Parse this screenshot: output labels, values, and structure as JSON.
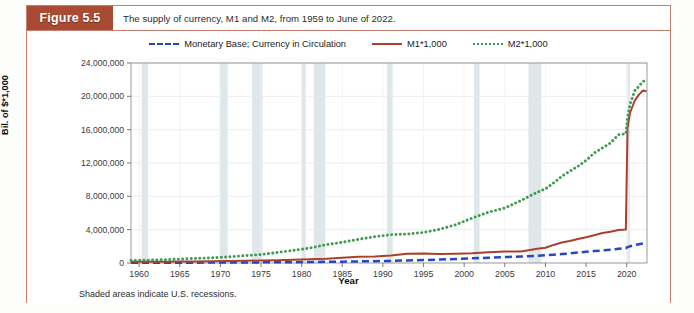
{
  "figure": {
    "badge_label": "Figure 5.5",
    "caption": "The supply of currency, M1 and M2, from 1959 to June of 2022.",
    "footnote": "Shaded areas indicate U.S. recessions.",
    "accent_color": "#a94a32",
    "frame_color": "#c77f72"
  },
  "chart_data": {
    "type": "line",
    "title": "The supply of currency, M1 and M2, from 1959 to June of 2022.",
    "xlabel": "Year",
    "ylabel": "Millions of Dollars,\nBil. of $*1,000",
    "ylabel_line1": "Millions of Dollars,",
    "ylabel_line2": "Bil. of $*1,000",
    "xlim": [
      1959,
      2022.5
    ],
    "ylim": [
      0,
      24000000
    ],
    "grid": true,
    "legend_position": "top-center",
    "x_ticks": [
      1960,
      1965,
      1970,
      1975,
      1980,
      1985,
      1990,
      1995,
      2000,
      2005,
      2010,
      2015,
      2020
    ],
    "x_tick_labels": [
      "1960",
      "1965",
      "1970",
      "1975",
      "1980",
      "1985",
      "1990",
      "1995",
      "2000",
      "2005",
      "2010",
      "2015",
      "2020"
    ],
    "y_ticks": [
      0,
      4000000,
      8000000,
      12000000,
      16000000,
      20000000,
      24000000
    ],
    "y_tick_labels": [
      "0",
      "4,000,000",
      "8,000,000",
      "12,000,000",
      "16,000,000",
      "20,000,000",
      "24,000,000"
    ],
    "x": [
      1959,
      1961,
      1963,
      1965,
      1967,
      1969,
      1971,
      1973,
      1975,
      1977,
      1979,
      1981,
      1983,
      1985,
      1987,
      1989,
      1991,
      1993,
      1995,
      1997,
      1999,
      2001,
      2003,
      2005,
      2007,
      2009,
      2010,
      2011,
      2012,
      2013,
      2014,
      2015,
      2016,
      2017,
      2018,
      2019,
      2019.9,
      2020.1,
      2020.4,
      2021,
      2021.5,
      2022,
      2022.45
    ],
    "series": [
      {
        "name": "Monetary Base; Currency in Circulation",
        "color": "#2546c8",
        "style": "dashed",
        "values": [
          30000,
          33000,
          36000,
          40000,
          44000,
          50000,
          56000,
          64000,
          74000,
          86000,
          102000,
          120000,
          140000,
          165000,
          195000,
          220000,
          255000,
          300000,
          355000,
          410000,
          490000,
          560000,
          630000,
          710000,
          780000,
          860000,
          920000,
          1000000,
          1080000,
          1150000,
          1250000,
          1340000,
          1430000,
          1500000,
          1600000,
          1700000,
          1780000,
          1900000,
          2000000,
          2150000,
          2250000,
          2330000,
          2380000
        ]
      },
      {
        "name": "M1*1,000",
        "color": "#a9402c",
        "style": "solid",
        "values": [
          140000,
          145000,
          155000,
          168000,
          185000,
          205000,
          230000,
          265000,
          295000,
          340000,
          390000,
          440000,
          500000,
          620000,
          760000,
          790000,
          900000,
          1100000,
          1130000,
          1080000,
          1120000,
          1180000,
          1300000,
          1370000,
          1370000,
          1700000,
          1830000,
          2170000,
          2450000,
          2640000,
          2870000,
          3090000,
          3340000,
          3600000,
          3760000,
          3970000,
          4020000,
          16200000,
          18000000,
          19500000,
          20200000,
          20700000,
          20600000
        ]
      },
      {
        "name": "M2*1,000",
        "color": "#3f9b4f",
        "style": "dotted",
        "values": [
          300000,
          340000,
          400000,
          470000,
          560000,
          620000,
          740000,
          880000,
          1020000,
          1270000,
          1520000,
          1790000,
          2200000,
          2490000,
          2840000,
          3160000,
          3400000,
          3480000,
          3670000,
          4050000,
          4600000,
          5400000,
          6100000,
          6600000,
          7500000,
          8500000,
          8900000,
          9600000,
          10400000,
          11000000,
          11600000,
          12300000,
          13200000,
          13800000,
          14400000,
          15400000,
          15500000,
          17400000,
          19000000,
          20700000,
          21200000,
          21800000,
          21900000
        ]
      }
    ],
    "recessions": [
      {
        "start": 1960.3,
        "end": 1961.1
      },
      {
        "start": 1969.9,
        "end": 1970.9
      },
      {
        "start": 1973.9,
        "end": 1975.2
      },
      {
        "start": 1980.0,
        "end": 1980.5
      },
      {
        "start": 1981.5,
        "end": 1982.9
      },
      {
        "start": 1990.5,
        "end": 1991.2
      },
      {
        "start": 2001.2,
        "end": 2001.9
      },
      {
        "start": 2007.9,
        "end": 2009.5
      },
      {
        "start": 2020.1,
        "end": 2020.4
      }
    ],
    "recession_color": "#dde6ea",
    "annotations": [
      "Shaded areas indicate U.S. recessions."
    ]
  }
}
